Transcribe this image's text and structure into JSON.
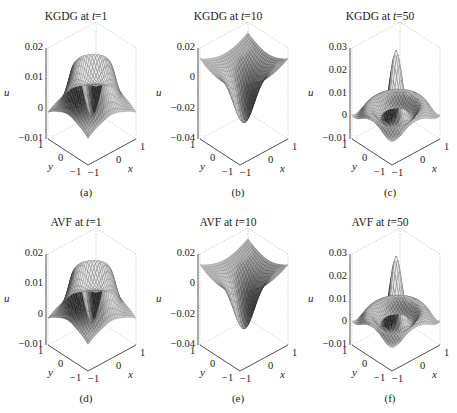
{
  "figure": {
    "panels": [
      {
        "id": "a",
        "title_prefix": "KGDG at ",
        "title_var": "t",
        "title_value": "=1",
        "label": "(a)",
        "zticks": [
          "0.02",
          "0.01",
          "0",
          "−0.01"
        ],
        "shape": "ring",
        "dark": "#3a3a3a"
      },
      {
        "id": "b",
        "title_prefix": "KGDG at ",
        "title_var": "t",
        "title_value": "=10",
        "label": "(b)",
        "zticks": [
          "0.02",
          "0",
          "−0.02",
          "−0.04"
        ],
        "shape": "well",
        "dark": "#2a2a2a"
      },
      {
        "id": "c",
        "title_prefix": "KGDG at ",
        "title_var": "t",
        "title_value": "=50",
        "label": "(c)",
        "zticks": [
          "0.03",
          "0.02",
          "0.01",
          "0",
          "−0.01"
        ],
        "shape": "peak",
        "dark": "#2a2a2a"
      },
      {
        "id": "d",
        "title_prefix": "AVF at ",
        "title_var": "t",
        "title_value": "=1",
        "label": "(d)",
        "zticks": [
          "0.02",
          "0.01",
          "0",
          "−0.01"
        ],
        "shape": "ring",
        "dark": "#3a3a3a"
      },
      {
        "id": "e",
        "title_prefix": "AVF at ",
        "title_var": "t",
        "title_value": "=10",
        "label": "(e)",
        "zticks": [
          "0.02",
          "0",
          "−0.02",
          "−0.04"
        ],
        "shape": "well",
        "dark": "#2a2a2a"
      },
      {
        "id": "f",
        "title_prefix": "AVF at ",
        "title_var": "t",
        "title_value": "=50",
        "label": "(f)",
        "zticks": [
          "0.03",
          "0.02",
          "0.01",
          "0",
          "−0.01"
        ],
        "shape": "peak",
        "dark": "#2a2a2a"
      }
    ],
    "axes": {
      "x_label": "x",
      "y_label": "y",
      "z_label": "u",
      "x_ticks": [
        "−1",
        "0",
        "1"
      ],
      "y_ticks": [
        "−1",
        "0",
        "1"
      ]
    }
  },
  "chart_data": [
    {
      "type": "surface3d",
      "title": "KGDG at t=1",
      "xlabel": "x",
      "ylabel": "y",
      "zlabel": "u",
      "xlim": [
        -1,
        1
      ],
      "ylim": [
        -1,
        1
      ],
      "zlim": [
        -0.01,
        0.02
      ],
      "zticks": [
        0.02,
        0.01,
        0,
        -0.01
      ],
      "xticks": [
        -1,
        0,
        1
      ],
      "yticks": [
        -1,
        0,
        1
      ],
      "description": "Ring-shaped crest (~0.015) with central dip, edges near 0, corners slightly negative",
      "caption": "(a)"
    },
    {
      "type": "surface3d",
      "title": "KGDG at t=10",
      "xlabel": "x",
      "ylabel": "y",
      "zlabel": "u",
      "xlim": [
        -1,
        1
      ],
      "ylim": [
        -1,
        1
      ],
      "zlim": [
        -0.04,
        0.02
      ],
      "zticks": [
        0.02,
        0,
        -0.02,
        -0.04
      ],
      "xticks": [
        -1,
        0,
        1
      ],
      "yticks": [
        -1,
        0,
        1
      ],
      "description": "Deep central well reaching about -0.035, edges/corners up to ~0.02",
      "caption": "(b)"
    },
    {
      "type": "surface3d",
      "title": "KGDG at t=50",
      "xlabel": "x",
      "ylabel": "y",
      "zlabel": "u",
      "xlim": [
        -1,
        1
      ],
      "ylim": [
        -1,
        1
      ],
      "zlim": [
        -0.01,
        0.03
      ],
      "zticks": [
        0.03,
        0.02,
        0.01,
        0,
        -0.01
      ],
      "xticks": [
        -1,
        0,
        1
      ],
      "yticks": [
        -1,
        0,
        1
      ],
      "description": "Central peak ~0.025 surrounded by oscillating ripples around 0",
      "caption": "(c)"
    },
    {
      "type": "surface3d",
      "title": "AVF at t=1",
      "xlabel": "x",
      "ylabel": "y",
      "zlabel": "u",
      "xlim": [
        -1,
        1
      ],
      "ylim": [
        -1,
        1
      ],
      "zlim": [
        -0.01,
        0.02
      ],
      "zticks": [
        0.02,
        0.01,
        0,
        -0.01
      ],
      "xticks": [
        -1,
        0,
        1
      ],
      "yticks": [
        -1,
        0,
        1
      ],
      "description": "Ring-shaped crest (~0.015) with central dip, edges near 0",
      "caption": "(d)"
    },
    {
      "type": "surface3d",
      "title": "AVF at t=10",
      "xlabel": "x",
      "ylabel": "y",
      "zlabel": "u",
      "xlim": [
        -1,
        1
      ],
      "ylim": [
        -1,
        1
      ],
      "zlim": [
        -0.04,
        0.02
      ],
      "zticks": [
        0.02,
        0,
        -0.02,
        -0.04
      ],
      "xticks": [
        -1,
        0,
        1
      ],
      "yticks": [
        -1,
        0,
        1
      ],
      "description": "Deep central well reaching about -0.035",
      "caption": "(e)"
    },
    {
      "type": "surface3d",
      "title": "AVF at t=50",
      "xlabel": "x",
      "ylabel": "y",
      "zlabel": "u",
      "xlim": [
        -1,
        1
      ],
      "ylim": [
        -1,
        1
      ],
      "zlim": [
        -0.01,
        0.03
      ],
      "zticks": [
        0.03,
        0.02,
        0.01,
        0,
        -0.01
      ],
      "xticks": [
        -1,
        0,
        1
      ],
      "yticks": [
        -1,
        0,
        1
      ],
      "description": "Central peak ~0.025 with ripples",
      "caption": "(f)"
    }
  ]
}
